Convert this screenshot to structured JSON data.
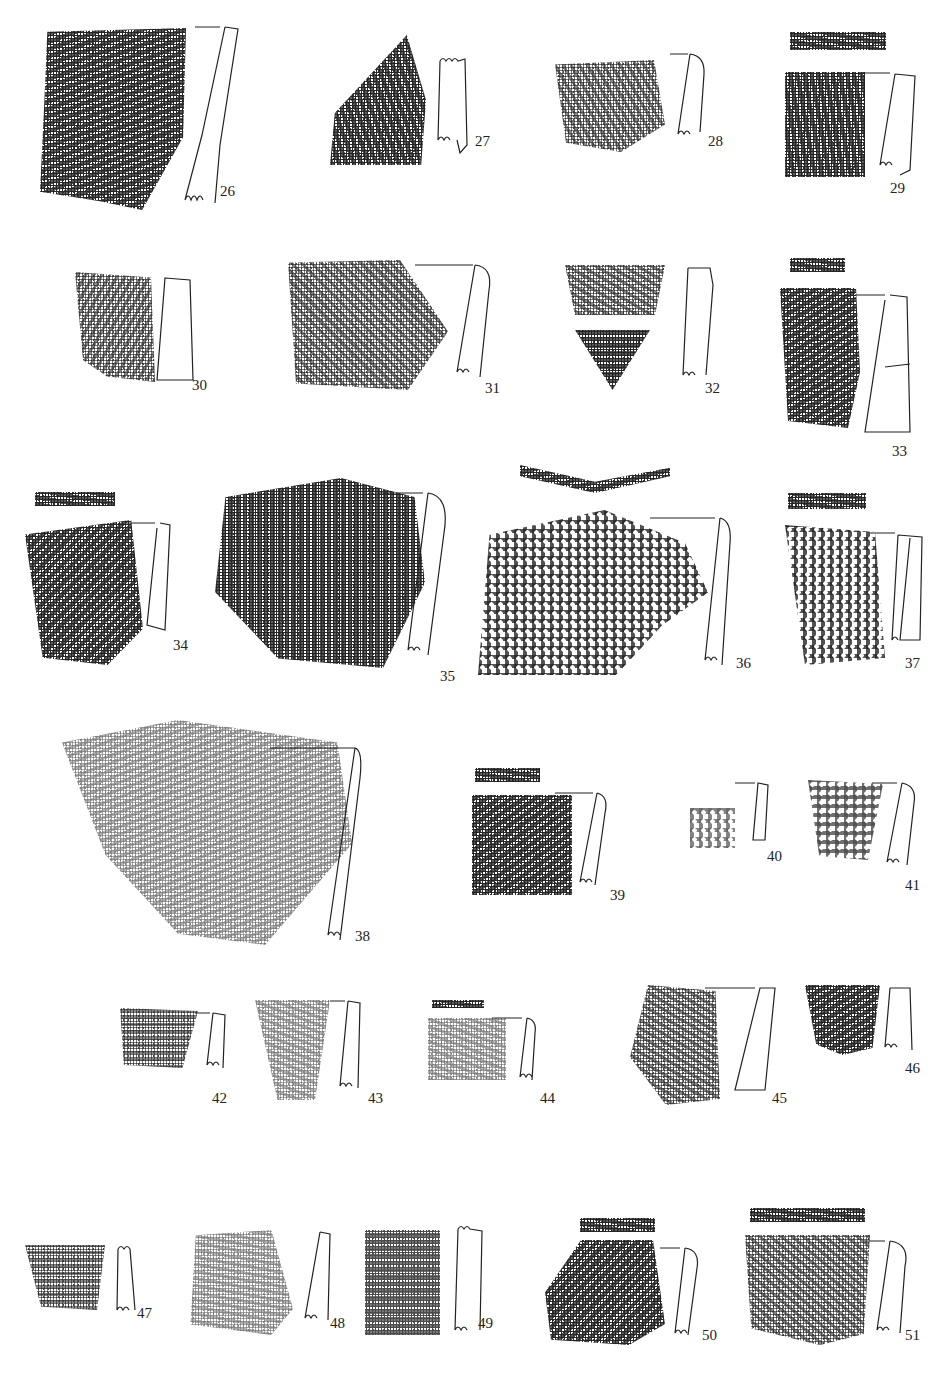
{
  "plate": {
    "caption": "",
    "figures": [
      {
        "id": "26",
        "label": "26"
      },
      {
        "id": "27",
        "label": "27"
      },
      {
        "id": "28",
        "label": "28"
      },
      {
        "id": "29",
        "label": "29"
      },
      {
        "id": "30",
        "label": "30"
      },
      {
        "id": "31",
        "label": "31"
      },
      {
        "id": "32",
        "label": "32"
      },
      {
        "id": "33",
        "label": "33"
      },
      {
        "id": "34",
        "label": "34"
      },
      {
        "id": "35",
        "label": "35"
      },
      {
        "id": "36",
        "label": "36"
      },
      {
        "id": "37",
        "label": "37"
      },
      {
        "id": "38",
        "label": "38"
      },
      {
        "id": "39",
        "label": "39"
      },
      {
        "id": "40",
        "label": "40"
      },
      {
        "id": "41",
        "label": "41"
      },
      {
        "id": "42",
        "label": "42"
      },
      {
        "id": "43",
        "label": "43"
      },
      {
        "id": "44",
        "label": "44"
      },
      {
        "id": "45",
        "label": "45"
      },
      {
        "id": "46",
        "label": "46"
      },
      {
        "id": "47",
        "label": "47"
      },
      {
        "id": "48",
        "label": "48"
      },
      {
        "id": "49",
        "label": "49"
      },
      {
        "id": "50",
        "label": "50"
      },
      {
        "id": "51",
        "label": "51"
      }
    ]
  }
}
